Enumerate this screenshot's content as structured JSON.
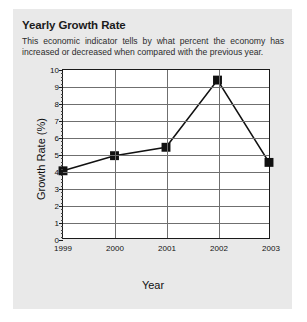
{
  "panel": {
    "title": "Yearly Growth Rate",
    "description": "This economic indicator tells by what percent the economy has increased or decreased when compared with the previous year."
  },
  "colors": {
    "panel_background": "#e9e9e9",
    "page_background": "#ffffff",
    "plot_background": "#ffffff",
    "axis": "#1a1a1a",
    "gridline": "#6f6f6f",
    "series": "#111111",
    "text": "#1b1b1b"
  },
  "chart_data": {
    "type": "line",
    "title": "",
    "xlabel": "Year",
    "ylabel": "Growth Rate (%)",
    "categories": [
      "1999",
      "2000",
      "2001",
      "2002",
      "2003"
    ],
    "values": [
      4.0,
      4.9,
      5.4,
      9.4,
      4.5
    ],
    "series": [
      {
        "name": "Growth Rate",
        "values": [
          4.0,
          4.9,
          5.4,
          9.4,
          4.5
        ],
        "marker": "square",
        "marker_color": "#111111",
        "line_color": "#111111"
      }
    ],
    "ylim": [
      0,
      10
    ],
    "yticks": [
      0,
      1,
      2,
      3,
      4,
      5,
      6,
      7,
      8,
      9,
      10
    ],
    "ytick_labels": [
      "0",
      "1",
      "2",
      "3",
      "4",
      "5",
      "6",
      "7",
      "8",
      "9",
      "10"
    ],
    "xticks": [
      "1999",
      "2000",
      "2001",
      "2002",
      "2003"
    ],
    "grid": "horizontal-and-vertical",
    "legend": "none"
  }
}
